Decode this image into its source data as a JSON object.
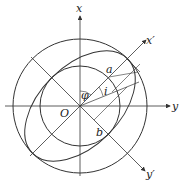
{
  "diagram": {
    "center": {
      "x": 80,
      "y": 106
    },
    "outer_circle_radius": 67,
    "inner_circle_radius": 40,
    "ellipse": {
      "a": 67,
      "b": 40,
      "rotation_deg": -45
    },
    "stroke_color": "#333333",
    "labels": {
      "x_axis": "x",
      "y_axis": "y",
      "x_prime": "x′",
      "y_prime": "y′",
      "origin": "O",
      "phi": "φ",
      "i": "i",
      "a": "a",
      "b": "b"
    }
  }
}
